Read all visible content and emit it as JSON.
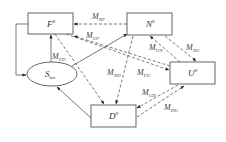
{
  "diagram": {
    "nodes": [
      {
        "id": "F",
        "label": "F",
        "superscript": "0",
        "shape": "rect"
      },
      {
        "id": "N",
        "label": "N",
        "superscript": "0",
        "shape": "rect"
      },
      {
        "id": "U",
        "label": "U",
        "superscript": "0",
        "shape": "rect"
      },
      {
        "id": "D",
        "label": "D",
        "superscript": "0",
        "shape": "rect"
      },
      {
        "id": "S",
        "label": "S",
        "subscript": "km",
        "shape": "ellipse"
      }
    ],
    "edges": [
      {
        "from": "N",
        "to": "F",
        "label": "M",
        "subscript": "NF",
        "style": "dashed"
      },
      {
        "from": "U",
        "to": "F",
        "label": "M",
        "subscript": "UF",
        "style": "dashed"
      },
      {
        "from": "S",
        "to": "F",
        "label": "M",
        "subscript": "FD",
        "style": "solid"
      },
      {
        "from": "F",
        "to": "D",
        "label": "",
        "style": "dashed"
      },
      {
        "from": "F",
        "to": "S",
        "label": "",
        "style": "solid"
      },
      {
        "from": "S",
        "to": "N",
        "label": "",
        "style": "solid"
      },
      {
        "from": "U",
        "to": "N",
        "label": "M",
        "subscript": "UN",
        "style": "dashed"
      },
      {
        "from": "N",
        "to": "U",
        "label": "M",
        "subscript": "NU",
        "style": "dashed"
      },
      {
        "from": "N",
        "to": "D",
        "label": "M",
        "subscript": "ND",
        "style": "dashed"
      },
      {
        "from": "F",
        "to": "U",
        "label": "M",
        "subscript": "FU",
        "style": "dashed"
      },
      {
        "from": "U",
        "to": "D",
        "label": "M",
        "subscript": "UD",
        "style": "dashed"
      },
      {
        "from": "D",
        "to": "U",
        "label": "M",
        "subscript": "DU",
        "style": "dashed"
      },
      {
        "from": "D",
        "to": "S",
        "label": "",
        "style": "solid"
      }
    ],
    "colors": {
      "stroke": "#555555",
      "text": "#333333",
      "background": "#ffffff"
    }
  }
}
